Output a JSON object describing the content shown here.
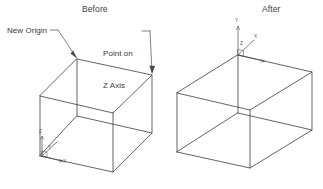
{
  "document": {
    "type": "technical-illustration",
    "background_color": "#ffffff",
    "line_color": "#3c3c3c",
    "text_color": "#3a3a3a",
    "width": 323,
    "height": 189
  },
  "panels": [
    {
      "id": "before",
      "title": "Before",
      "description": "Wireframe isometric cube with default UCS at bottom-left corner"
    },
    {
      "id": "after",
      "title": "After",
      "description": "Wireframe isometric cube with relocated UCS at top-rear corner"
    }
  ],
  "annotations": [
    {
      "id": "new-origin",
      "text": "New Origin",
      "lines": [
        "New Origin"
      ],
      "points_to": "top-rear corner of left cube"
    },
    {
      "id": "point-on-z-axis",
      "text": "Point on Z Axis",
      "lines": [
        "Point on",
        "Z Axis"
      ],
      "points_to": "top-right corner of left cube"
    }
  ],
  "ucs_icons": [
    {
      "id": "ucs-before",
      "location": "bottom-left corner of left cube",
      "axis_labels": [
        "Z",
        "Y",
        "X"
      ]
    },
    {
      "id": "ucs-after",
      "location": "top-rear corner of right cube",
      "axis_labels": [
        "Y",
        "Z",
        "X"
      ]
    }
  ],
  "geometry": {
    "left_cube": {
      "top_rear": [
        77,
        59
      ],
      "top_right": [
        152,
        75
      ],
      "top_front": [
        113,
        113
      ],
      "top_left": [
        40,
        96
      ],
      "bottom_rear": [
        77,
        116
      ],
      "bottom_right": [
        152,
        133
      ],
      "bottom_front": [
        113,
        172
      ],
      "bottom_left": [
        40,
        156
      ]
    },
    "right_cube": {
      "top_rear": [
        238,
        55
      ],
      "top_right": [
        312,
        72
      ],
      "top_front": [
        250,
        110
      ],
      "top_left": [
        177,
        93
      ],
      "bottom_rear": [
        238,
        113
      ],
      "bottom_right": [
        312,
        130
      ],
      "bottom_front": [
        250,
        168
      ],
      "bottom_left": [
        177,
        152
      ]
    }
  }
}
